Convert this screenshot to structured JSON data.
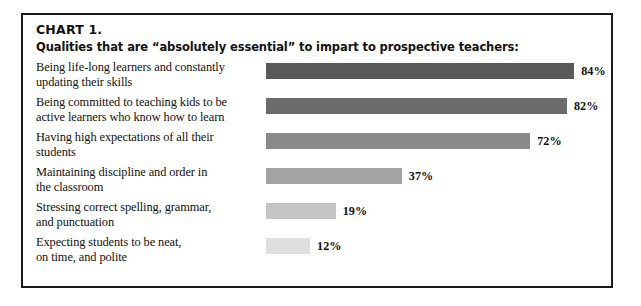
{
  "chart_data": {
    "type": "bar",
    "orientation": "horizontal",
    "title": "CHART 1.",
    "subtitle": "Qualities that are “absolutely essential” to impart to prospective teachers:",
    "xlabel": "",
    "ylabel": "",
    "xlim": [
      0,
      100
    ],
    "grid": false,
    "legend": "none",
    "value_suffix": "%",
    "categories": [
      "Being life-long learners and constantly updating their skills",
      "Being committed to teaching kids to be active learners who know how to learn",
      "Having high expectations of all their students",
      "Maintaining discipline and order in the classroom",
      "Stressing correct spelling, grammar, and punctuation",
      "Expecting students to be neat, on time, and polite"
    ],
    "values": [
      84,
      82,
      72,
      37,
      19,
      12
    ],
    "bars": [
      {
        "label_line1": "Being life-long learners and constantly",
        "label_line2": "updating their skills",
        "value": 84,
        "value_label": "84%",
        "color": "#595959"
      },
      {
        "label_line1": "Being committed to teaching kids to be",
        "label_line2": "active learners who know how to learn",
        "value": 82,
        "value_label": "82%",
        "color": "#6b6b6b"
      },
      {
        "label_line1": "Having high expectations of all their",
        "label_line2": "students",
        "value": 72,
        "value_label": "72%",
        "color": "#8a8a8a"
      },
      {
        "label_line1": "Maintaining discipline and order in",
        "label_line2": "the classroom",
        "value": 37,
        "value_label": "37%",
        "color": "#a3a3a3"
      },
      {
        "label_line1": "Stressing correct spelling, grammar,",
        "label_line2": "and punctuation",
        "value": 19,
        "value_label": "19%",
        "color": "#c4c4c4"
      },
      {
        "label_line1": "Expecting students to be neat,",
        "label_line2": "on time, and polite",
        "value": 12,
        "value_label": "12%",
        "color": "#dedede"
      }
    ],
    "colors": {
      "border": "#1a1a1a",
      "background": "#ffffff",
      "text": "#111111"
    }
  }
}
